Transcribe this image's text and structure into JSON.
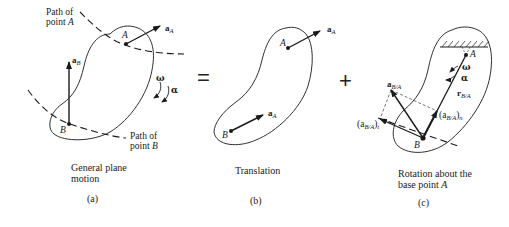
{
  "panels": [
    {
      "id": "a",
      "caption_line1": "General plane",
      "caption_line2": "motion",
      "sublabel": "(a)",
      "path_a_line1": "Path of",
      "path_a_line2": "point A",
      "path_b_line1": "Path of",
      "path_b_line2": "point B",
      "point_a": "A",
      "point_b": "B",
      "vec_aA": "a",
      "vec_aA_sub": "A",
      "vec_aB": "a",
      "vec_aB_sub": "B",
      "omega": "ω",
      "alpha": "α"
    },
    {
      "id": "b",
      "caption": "Translation",
      "sublabel": "(b)",
      "point_a": "A",
      "point_b": "B",
      "vec_top": "a",
      "vec_top_sub": "A",
      "vec_bottom": "a",
      "vec_bottom_sub": "A"
    },
    {
      "id": "c",
      "caption_line1": "Rotation about the",
      "caption_line2": "base point A",
      "sublabel": "(c)",
      "point_a": "A",
      "point_b": "B",
      "omega": "ω",
      "alpha": "α",
      "vec_aBA": "a",
      "vec_aBA_sub": "B/A",
      "vec_rBA": "r",
      "vec_rBA_sub": "B/A",
      "vec_n": "(a",
      "vec_n_sub": "B/A",
      "vec_n_tail": ")",
      "vec_n_subsub": "n",
      "vec_t": "(a",
      "vec_t_sub": "B/A",
      "vec_t_tail": ")",
      "vec_t_subsub": "t"
    }
  ],
  "operators": {
    "equals": "=",
    "plus": "+"
  },
  "colors": {
    "ink": "#1a1a1a",
    "background": "#ffffff"
  }
}
